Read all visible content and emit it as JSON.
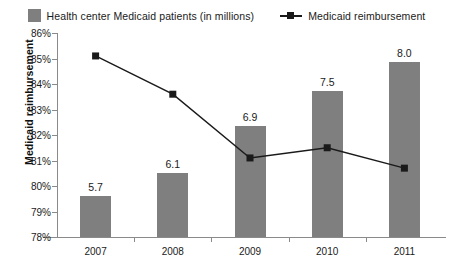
{
  "legend": {
    "items": [
      {
        "label": "Health center Medicaid patients (in millions)",
        "marker": "bar-swatch-icon",
        "color": "#7f7f7f"
      },
      {
        "label": "Medicaid reimbursement",
        "marker": "line-marker-icon",
        "color": "#1a1a1a"
      }
    ]
  },
  "axes": {
    "y_title": "Medicaid reimbursement",
    "y_ticks": [
      "78%",
      "79%",
      "80%",
      "81%",
      "82%",
      "83%",
      "84%",
      "85%",
      "86%"
    ],
    "x_ticks": [
      "2007",
      "2008",
      "2009",
      "2010",
      "2011"
    ]
  },
  "chart_data": {
    "type": "bar",
    "title": "",
    "subtitle": "",
    "xlabel": "",
    "ylabel": "Medicaid reimbursement",
    "categories": [
      "2007",
      "2008",
      "2009",
      "2010",
      "2011"
    ],
    "grid": false,
    "legend_position": "top-center",
    "ylim": [
      78,
      86
    ],
    "ytick_step": 1,
    "ytick_labels": [
      "78%",
      "79%",
      "80%",
      "81%",
      "82%",
      "83%",
      "84%",
      "85%",
      "86%"
    ],
    "series": [
      {
        "name": "Health center Medicaid patients (in millions)",
        "type": "bar",
        "color": "#7f7f7f",
        "axis": "secondary",
        "unit": "millions",
        "values": [
          5.7,
          6.1,
          6.9,
          7.5,
          8.0
        ],
        "data_labels": [
          "5.7",
          "6.1",
          "6.9",
          "7.5",
          "8.0"
        ],
        "secondary_ylim": [
          5.0,
          8.5
        ]
      },
      {
        "name": "Medicaid reimbursement",
        "type": "line",
        "color": "#1a1a1a",
        "axis": "primary",
        "unit": "percent",
        "marker": "square",
        "values": [
          85.1,
          83.6,
          81.1,
          81.5,
          80.7
        ],
        "data_labels": []
      }
    ]
  }
}
